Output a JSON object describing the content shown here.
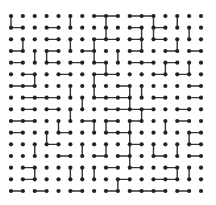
{
  "game": {
    "type": "dot-grid-puzzle",
    "columns": 17,
    "rows": 16,
    "colors": {
      "dot": "#222222",
      "edge": "#333333",
      "background": "#ffffff"
    },
    "edges": [
      [
        0,
        0,
        0,
        1
      ],
      [
        0,
        1,
        1,
        1
      ],
      [
        3,
        1,
        4,
        1
      ],
      [
        1,
        2,
        1,
        3
      ],
      [
        3,
        2,
        4,
        2
      ],
      [
        0,
        3,
        1,
        3
      ],
      [
        2,
        3,
        2,
        4
      ],
      [
        3,
        3,
        4,
        3
      ],
      [
        3,
        3,
        3,
        4
      ],
      [
        0,
        4,
        1,
        4
      ],
      [
        3,
        4,
        4,
        4
      ],
      [
        5,
        0,
        5,
        1
      ],
      [
        5,
        2,
        5,
        3
      ],
      [
        7,
        0,
        8,
        0
      ],
      [
        8,
        0,
        9,
        0
      ],
      [
        8,
        0,
        8,
        1
      ],
      [
        8,
        1,
        8,
        2
      ],
      [
        7,
        2,
        8,
        2
      ],
      [
        8,
        2,
        9,
        2
      ],
      [
        7,
        2,
        7,
        3
      ],
      [
        6,
        3,
        7,
        3
      ],
      [
        7,
        3,
        7,
        4
      ],
      [
        9,
        3,
        9,
        4
      ],
      [
        5,
        4,
        6,
        4
      ],
      [
        7,
        4,
        8,
        4
      ],
      [
        8,
        4,
        8,
        5
      ],
      [
        10,
        0,
        11,
        0
      ],
      [
        11,
        0,
        12,
        0
      ],
      [
        12,
        0,
        12,
        1
      ],
      [
        12,
        1,
        12,
        2
      ],
      [
        10,
        1,
        11,
        1
      ],
      [
        11,
        1,
        11,
        2
      ],
      [
        11,
        2,
        11,
        3
      ],
      [
        10,
        2,
        11,
        2
      ],
      [
        10,
        3,
        11,
        3
      ],
      [
        14,
        0,
        14,
        1
      ],
      [
        12,
        1,
        13,
        1
      ],
      [
        15,
        1,
        15,
        2
      ],
      [
        12,
        2,
        13,
        2
      ],
      [
        14,
        2,
        14,
        3
      ],
      [
        13,
        3,
        14,
        3
      ],
      [
        15,
        3,
        16,
        3
      ],
      [
        10,
        4,
        11,
        4
      ],
      [
        11,
        4,
        12,
        4
      ],
      [
        13,
        4,
        14,
        4
      ],
      [
        13,
        4,
        13,
        5
      ],
      [
        15,
        4,
        15,
        5
      ],
      [
        1,
        5,
        2,
        5
      ],
      [
        2,
        5,
        2,
        6
      ],
      [
        4,
        5,
        5,
        5
      ],
      [
        0,
        6,
        1,
        6
      ],
      [
        1,
        6,
        2,
        6
      ],
      [
        5,
        6,
        5,
        7
      ],
      [
        1,
        7,
        2,
        7
      ],
      [
        2,
        7,
        3,
        7
      ],
      [
        3,
        7,
        4,
        7
      ],
      [
        1,
        8,
        2,
        8
      ],
      [
        3,
        8,
        4,
        8
      ],
      [
        5,
        8,
        5,
        9
      ],
      [
        0,
        9,
        1,
        9
      ],
      [
        1,
        9,
        2,
        9
      ],
      [
        4,
        9,
        4,
        10
      ],
      [
        7,
        5,
        8,
        5
      ],
      [
        8,
        5,
        9,
        5
      ],
      [
        7,
        5,
        7,
        6
      ],
      [
        7,
        6,
        7,
        7
      ],
      [
        9,
        6,
        10,
        6
      ],
      [
        10,
        6,
        10,
        7
      ],
      [
        11,
        6,
        11,
        7
      ],
      [
        6,
        7,
        6,
        8
      ],
      [
        7,
        7,
        8,
        7
      ],
      [
        8,
        7,
        9,
        7
      ],
      [
        9,
        7,
        10,
        7
      ],
      [
        10,
        7,
        10,
        8
      ],
      [
        8,
        8,
        9,
        8
      ],
      [
        9,
        8,
        10,
        8
      ],
      [
        10,
        8,
        11,
        8
      ],
      [
        11,
        8,
        12,
        8
      ],
      [
        11,
        8,
        11,
        9
      ],
      [
        6,
        9,
        7,
        9
      ],
      [
        8,
        9,
        9,
        9
      ],
      [
        10,
        9,
        11,
        9
      ],
      [
        10,
        9,
        10,
        10
      ],
      [
        8,
        9,
        8,
        10
      ],
      [
        7,
        9,
        7,
        10
      ],
      [
        12,
        5,
        13,
        5
      ],
      [
        14,
        5,
        15,
        5
      ],
      [
        15,
        6,
        16,
        6
      ],
      [
        12,
        7,
        13,
        7
      ],
      [
        15,
        7,
        16,
        7
      ],
      [
        14,
        8,
        15,
        8
      ],
      [
        13,
        9,
        13,
        10
      ],
      [
        14,
        9,
        15,
        9
      ],
      [
        0,
        10,
        1,
        10
      ],
      [
        3,
        10,
        3,
        11
      ],
      [
        4,
        10,
        5,
        10
      ],
      [
        2,
        11,
        2,
        12
      ],
      [
        3,
        11,
        4,
        11
      ],
      [
        4,
        12,
        5,
        12
      ],
      [
        1,
        13,
        2,
        13
      ],
      [
        2,
        13,
        2,
        14
      ],
      [
        5,
        13,
        5,
        14
      ],
      [
        1,
        14,
        2,
        14
      ],
      [
        0,
        15,
        1,
        15
      ],
      [
        2,
        15,
        3,
        15
      ],
      [
        5,
        15,
        6,
        15
      ],
      [
        8,
        10,
        9,
        10
      ],
      [
        9,
        10,
        10,
        10
      ],
      [
        10,
        10,
        10,
        11
      ],
      [
        6,
        11,
        6,
        12
      ],
      [
        8,
        11,
        8,
        12
      ],
      [
        10,
        11,
        11,
        11
      ],
      [
        10,
        11,
        10,
        12
      ],
      [
        7,
        12,
        8,
        12
      ],
      [
        9,
        12,
        10,
        12
      ],
      [
        10,
        12,
        10,
        13
      ],
      [
        6,
        13,
        6,
        14
      ],
      [
        7,
        13,
        7,
        14
      ],
      [
        8,
        13,
        9,
        13
      ],
      [
        10,
        13,
        11,
        13
      ],
      [
        9,
        14,
        10,
        14
      ],
      [
        9,
        14,
        9,
        15
      ],
      [
        8,
        15,
        9,
        15
      ],
      [
        10,
        15,
        11,
        15
      ],
      [
        11,
        15,
        12,
        15
      ],
      [
        12,
        15,
        13,
        15
      ],
      [
        15,
        10,
        16,
        10
      ],
      [
        15,
        10,
        15,
        11
      ],
      [
        12,
        11,
        12,
        12
      ],
      [
        14,
        11,
        14,
        12
      ],
      [
        15,
        11,
        16,
        11
      ],
      [
        12,
        12,
        13,
        12
      ],
      [
        15,
        12,
        16,
        12
      ],
      [
        13,
        13,
        14,
        13
      ],
      [
        14,
        13,
        14,
        14
      ],
      [
        15,
        13,
        15,
        14
      ],
      [
        12,
        14,
        13,
        14
      ],
      [
        13,
        14,
        14,
        14
      ],
      [
        14,
        15,
        15,
        15
      ]
    ]
  }
}
